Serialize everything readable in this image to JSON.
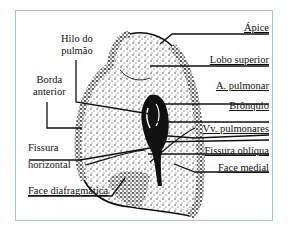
{
  "figure": {
    "type": "anatomical-diagram",
    "frame_border_color": "#a9c4d6",
    "labels": {
      "apice": "Ápice",
      "lobo_superior": "Lobo superior",
      "a_pulmonar": "A. pulmonar",
      "bronquio": "Brônquio",
      "vv_pulmonares": "Vv. pulmonares",
      "fissura_obliqua": "Fissura oblíqua",
      "face_medial": "Face medial",
      "hilo_line1": "Hilo do",
      "hilo_line2": "pulmão",
      "borda_line1": "Borda",
      "borda_line2": "anterior",
      "fissura_h_line1": "Fissura",
      "fissura_h_line2": "horizontal",
      "face_diafragmatica": "Face diafragmática"
    }
  }
}
